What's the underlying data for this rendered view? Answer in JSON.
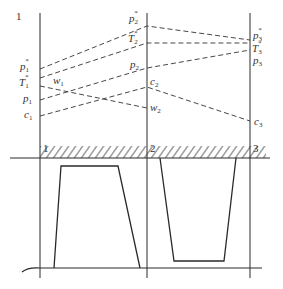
{
  "diagram": {
    "stations": [
      {
        "id": "1",
        "top_label": "1",
        "bottom_label": "1",
        "x": 40
      },
      {
        "id": "2",
        "top_label": "",
        "bottom_label": "2",
        "x": 147
      },
      {
        "id": "3",
        "top_label": "",
        "bottom_label": "3",
        "x": 250
      }
    ],
    "left_labels": [
      {
        "base": "p",
        "sub": "1",
        "sup": "*",
        "y": 70
      },
      {
        "base": "T",
        "sub": "1",
        "sup": "*",
        "y": 86
      },
      {
        "base": "p",
        "sub": "1",
        "sup": "",
        "y": 102
      },
      {
        "base": "c",
        "sub": "1",
        "sup": "",
        "y": 118
      }
    ],
    "mid_labels": [
      {
        "base": "w",
        "sub": "1",
        "sup": "",
        "x": 52,
        "y": 84
      },
      {
        "base": "p",
        "sub": "2",
        "sup": "*",
        "x": 128,
        "y": 22
      },
      {
        "base": "T",
        "sub": "2",
        "sup": "*",
        "x": 128,
        "y": 41
      },
      {
        "base": "p",
        "sub": "2",
        "sup": "",
        "x": 128,
        "y": 67
      },
      {
        "base": "c",
        "sub": "2",
        "sup": "",
        "x": 150,
        "y": 84
      },
      {
        "base": "w",
        "sub": "2",
        "sup": "",
        "x": 150,
        "y": 111
      }
    ],
    "right_labels": [
      {
        "base": "p",
        "sub": "3",
        "sup": "*",
        "y": 38
      },
      {
        "base": "T",
        "sub": "3",
        "sup": "*",
        "y": 50
      },
      {
        "base": "p",
        "sub": "3",
        "sup": "",
        "y": 64
      },
      {
        "base": "c",
        "sub": "3",
        "sup": "",
        "y": 125
      }
    ],
    "dashed_lines": [
      {
        "name": "p-star",
        "points": [
          [
            40,
            69
          ],
          [
            147,
            26
          ],
          [
            250,
            40
          ]
        ]
      },
      {
        "name": "T-star",
        "points": [
          [
            40,
            78
          ],
          [
            147,
            43
          ],
          [
            250,
            43
          ]
        ]
      },
      {
        "name": "w",
        "points": [
          [
            40,
            86
          ],
          [
            147,
            108
          ]
        ]
      },
      {
        "name": "p",
        "points": [
          [
            40,
            100
          ],
          [
            147,
            68
          ],
          [
            250,
            50
          ]
        ]
      },
      {
        "name": "c",
        "points": [
          [
            40,
            116
          ],
          [
            147,
            87
          ],
          [
            250,
            121
          ]
        ]
      }
    ],
    "colors": {
      "ink": "#2a2a2a",
      "background": "#ffffff"
    }
  }
}
